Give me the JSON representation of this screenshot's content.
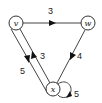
{
  "graph": {
    "nodes": [
      {
        "id": "v",
        "label": "v",
        "x": 16,
        "y": 23
      },
      {
        "id": "w",
        "label": "w",
        "x": 88,
        "y": 23
      },
      {
        "id": "x",
        "label": "x",
        "x": 53,
        "y": 89
      }
    ],
    "edges": [
      {
        "from": "v",
        "to": "w",
        "weight": "3"
      },
      {
        "from": "v",
        "to": "x",
        "weight": "5"
      },
      {
        "from": "x",
        "to": "v",
        "weight": "3"
      },
      {
        "from": "w",
        "to": "x",
        "weight": "4"
      },
      {
        "from": "x",
        "to": "x",
        "weight": "5"
      }
    ]
  },
  "labels": {
    "node_v": "v",
    "node_w": "w",
    "node_x": "x",
    "edge_vw": "3",
    "edge_vx": "5",
    "edge_xv": "3",
    "edge_wx": "4",
    "edge_xx": "5"
  }
}
